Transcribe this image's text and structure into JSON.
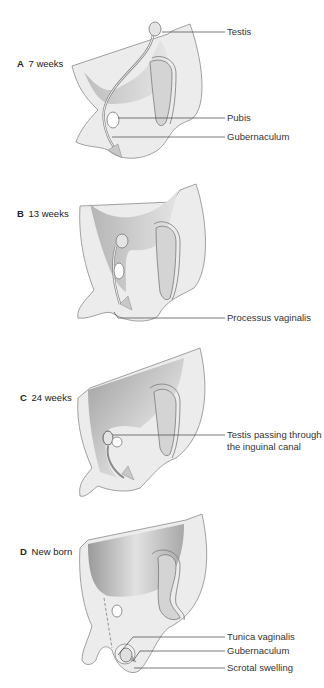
{
  "figure": {
    "panels": [
      {
        "letter": "A",
        "stage": "7 weeks",
        "callouts": [
          "Testis",
          "Pubis",
          "Gubernaculum"
        ]
      },
      {
        "letter": "B",
        "stage": "13 weeks",
        "callouts": [
          "Processus vaginalis"
        ]
      },
      {
        "letter": "C",
        "stage": "24 weeks",
        "callouts": [
          "Testis passing through",
          "the inguinal canal"
        ]
      },
      {
        "letter": "D",
        "stage": "New born",
        "callouts": [
          "Tunica vaginalis",
          "Gubernaculum",
          "Scrotal swelling"
        ]
      }
    ],
    "colors": {
      "tissue_fill": "#ececec",
      "tissue_stroke": "#8a8a8a",
      "cavity_shade": "#9a9a9a",
      "organ_fill": "#d4d4d4",
      "leader_line": "#444444",
      "background": "#ffffff"
    }
  }
}
